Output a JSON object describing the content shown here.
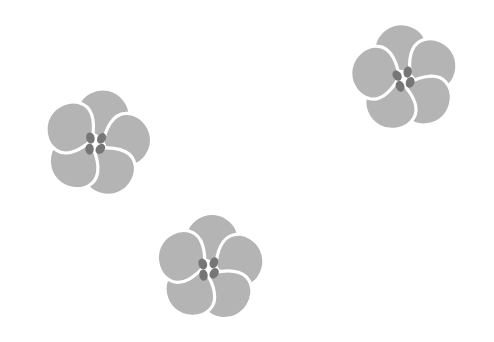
{
  "canvas": {
    "width": 494,
    "height": 342,
    "background_color": "#ffffff",
    "title": "Three Gray Flowers"
  },
  "palette": {
    "background": "#ffffff",
    "petal_fill": "#b4b4b4",
    "petal_gap": "#ffffff",
    "stamen_dot": "#767676"
  },
  "motif": {
    "name": "five-petal-flower",
    "petal_count": 5,
    "stamen_dot_count": 4,
    "petal_radius": 36,
    "petal_width": 26,
    "petal_length": 34,
    "stamen_dot_rx": 4.2,
    "stamen_dot_ry": 5.6
  },
  "flowers": [
    {
      "id": "flower-left",
      "label": "Left flower",
      "center_x": 97,
      "center_y": 143,
      "scale": 1.0,
      "rotation": 12,
      "bbox": [
        32,
        88,
        162,
        197
      ]
    },
    {
      "id": "flower-top-right",
      "label": "Top right flower",
      "center_x": 405,
      "center_y": 78,
      "scale": 1.0,
      "rotation": -8,
      "bbox": [
        340,
        20,
        470,
        135
      ]
    },
    {
      "id": "flower-bottom-center",
      "label": "Bottom center flower",
      "center_x": 210,
      "center_y": 268,
      "scale": 1.0,
      "rotation": 4,
      "bbox": [
        145,
        210,
        275,
        325
      ]
    }
  ],
  "petal_angles": [
    -90,
    -18,
    54,
    126,
    198
  ],
  "stamen_offsets": [
    {
      "dx": -7.5,
      "dy": -3.5,
      "rot": -25
    },
    {
      "dx": 3.5,
      "dy": -5.5,
      "rot": 18
    },
    {
      "dx": -6.0,
      "dy": 7.5,
      "rot": -12
    },
    {
      "dx": 4.5,
      "dy": 5.0,
      "rot": 30
    }
  ]
}
